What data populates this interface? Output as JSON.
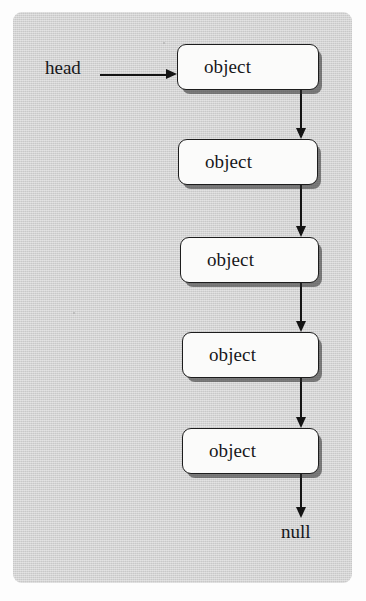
{
  "figure": {
    "type": "linked-list-diagram",
    "title": "",
    "frame": {
      "background_color": "#d2d2d2",
      "border_color": "#2c2c2c",
      "x": 13,
      "y": 12,
      "width": 339,
      "height": 571,
      "corner_radius": 9
    },
    "pointer": {
      "head_label": "head",
      "head_arrow_direction": "right"
    },
    "terminator": {
      "null_label": "null"
    },
    "nodes": [
      {
        "label": "object",
        "x": 177,
        "y": 44,
        "width": 142,
        "height": 46
      },
      {
        "label": "object",
        "x": 178,
        "y": 139,
        "width": 140,
        "height": 46
      },
      {
        "label": "object",
        "x": 180,
        "y": 237,
        "width": 139,
        "height": 46
      },
      {
        "label": "object",
        "x": 182,
        "y": 332,
        "width": 137,
        "height": 46
      },
      {
        "label": "object",
        "x": 182,
        "y": 428,
        "width": 137,
        "height": 46
      }
    ],
    "connectors": [
      {
        "from": "node-1",
        "to": "node-2",
        "x": 300,
        "y": 90,
        "length": 49,
        "arrow": "down"
      },
      {
        "from": "node-2",
        "to": "node-3",
        "x": 300,
        "y": 185,
        "length": 52,
        "arrow": "down"
      },
      {
        "from": "node-3",
        "to": "node-4",
        "x": 300,
        "y": 283,
        "length": 49,
        "arrow": "down"
      },
      {
        "from": "node-4",
        "to": "node-5",
        "x": 300,
        "y": 378,
        "length": 50,
        "arrow": "down"
      },
      {
        "from": "node-5",
        "to": "null",
        "x": 300,
        "y": 474,
        "length": 44,
        "arrow": "down"
      }
    ],
    "colors": {
      "node_fill": "#fbfbfa",
      "node_border": "#1d1d1d",
      "line": "#141414",
      "text": "#17171a",
      "page": "#fdfdfd"
    }
  }
}
